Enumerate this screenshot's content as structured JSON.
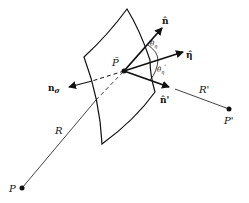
{
  "diagram": {
    "labels": {
      "p_tilde": "P̃",
      "n_hat": "n̂",
      "eta_hat": "η̂",
      "n_hat_prime": "n̂'",
      "n_sigma_base": "n",
      "n_sigma_sub": "σ",
      "theta_eta": "θ",
      "theta_eta_sub": "η",
      "theta_eta_prime": "θ",
      "theta_eta_prime_sub": "η",
      "theta_prime_mark": "'",
      "R": "R",
      "R_prime": "R'",
      "P": "P",
      "P_prime": "P'"
    },
    "colors": {
      "stroke": "#111111",
      "background": "#ffffff"
    }
  }
}
